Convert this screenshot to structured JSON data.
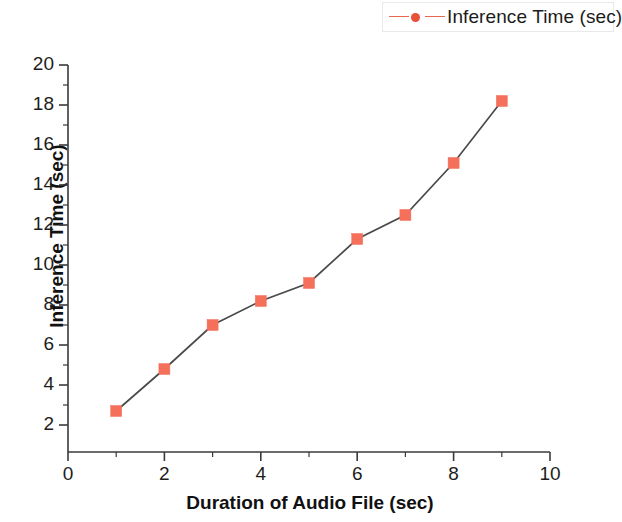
{
  "legend": {
    "label": "Inference Time (sec)",
    "marker_icon": "square-marker-icon",
    "marker_color": "#f4705a",
    "line_color": "#e8674f",
    "position": "top-right"
  },
  "chart_data": {
    "type": "line",
    "title": "",
    "subtitle": "",
    "xlabel": "Duration of Audio File (sec)",
    "ylabel": "Inference Time (sec)",
    "xlim": [
      0,
      10
    ],
    "ylim": [
      0.65,
      20
    ],
    "xticks": [
      0,
      2,
      4,
      6,
      8,
      10
    ],
    "yticks": [
      2,
      4,
      6,
      8,
      10,
      12,
      14,
      16,
      18,
      20
    ],
    "xtick_labels": [
      "0",
      "2",
      "4",
      "6",
      "8",
      "10"
    ],
    "ytick_labels": [
      "2",
      "4",
      "6",
      "8",
      "10",
      "12",
      "14",
      "16",
      "18",
      "20"
    ],
    "minor_ticks": true,
    "grid": false,
    "x": [
      1,
      2,
      3,
      4,
      5,
      6,
      7,
      8,
      9
    ],
    "series": [
      {
        "name": "Inference Time (sec)",
        "values": [
          2.7,
          4.8,
          7.0,
          8.2,
          9.1,
          11.3,
          12.5,
          15.1,
          18.2
        ],
        "color": "#f4705a",
        "line_color": "#4a4a4a",
        "marker": "square"
      }
    ]
  }
}
